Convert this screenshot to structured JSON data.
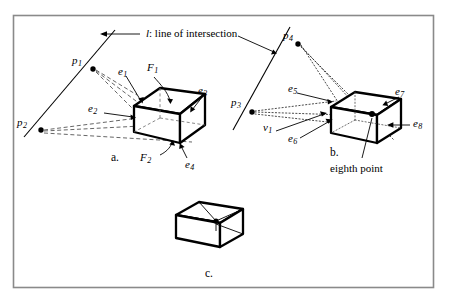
{
  "figure": {
    "caption_italic_symbol": "l",
    "caption_text": ": line of intersection",
    "panels": [
      {
        "id": "a",
        "label": "a."
      },
      {
        "id": "b",
        "label": "b."
      },
      {
        "id": "c",
        "label": "c."
      }
    ],
    "colors": {
      "stroke": "#000000",
      "background": "#ffffff",
      "frame": "#8a8a8a",
      "dashed": "#4a4a4a",
      "dotted": "#3a3a3a"
    },
    "panel_a": {
      "points": [
        {
          "name": "p1",
          "base": "p",
          "sub": "1"
        },
        {
          "name": "p2",
          "base": "p",
          "sub": "2"
        }
      ],
      "edges": [
        {
          "name": "e1",
          "base": "e",
          "sub": "1"
        },
        {
          "name": "e2",
          "base": "e",
          "sub": "2"
        },
        {
          "name": "e3",
          "base": "e",
          "sub": "3"
        },
        {
          "name": "e4",
          "base": "e",
          "sub": "4"
        }
      ],
      "faces": [
        {
          "name": "F1",
          "base": "F",
          "sub": "1"
        },
        {
          "name": "F2",
          "base": "F",
          "sub": "2"
        }
      ]
    },
    "panel_b": {
      "points": [
        {
          "name": "p3",
          "base": "p",
          "sub": "3"
        },
        {
          "name": "p4",
          "base": "p",
          "sub": "4"
        }
      ],
      "edges": [
        {
          "name": "e5",
          "base": "e",
          "sub": "5"
        },
        {
          "name": "e6",
          "base": "e",
          "sub": "6"
        },
        {
          "name": "e7",
          "base": "e",
          "sub": "7"
        },
        {
          "name": "e8",
          "base": "e",
          "sub": "8"
        }
      ],
      "vertices": [
        {
          "name": "v1",
          "base": "v",
          "sub": "1"
        }
      ],
      "annotation": "eighth point"
    }
  }
}
